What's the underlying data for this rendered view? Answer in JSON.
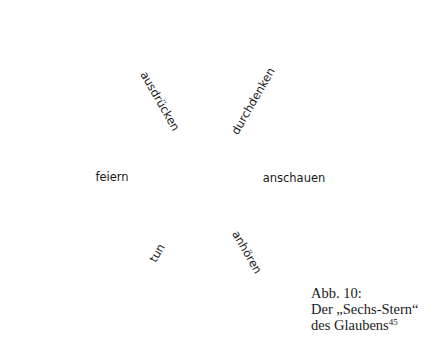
{
  "figure": {
    "type": "six-pointed star of rhombi (Sechs-Stern)",
    "segments": [
      {
        "id": "top-left",
        "label": "ausdrücken"
      },
      {
        "id": "top-right",
        "label": "durchdenken"
      },
      {
        "id": "left",
        "label": "feiern"
      },
      {
        "id": "right",
        "label": "anschauen"
      },
      {
        "id": "bottom-left",
        "label": "tun"
      },
      {
        "id": "bottom-right",
        "label": "anhören"
      }
    ],
    "line_color": "#1a1a1a",
    "background": "#ffffff"
  },
  "caption": {
    "line1": "Abb. 10:",
    "line2": "Der „Sechs-Stern“",
    "line3": "des Glaubens",
    "footnote": "45"
  }
}
